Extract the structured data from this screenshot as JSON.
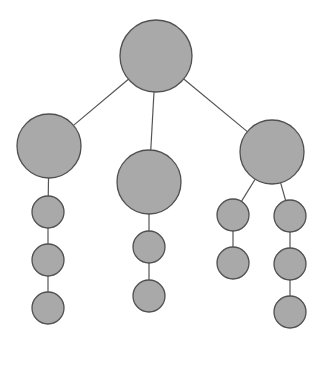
{
  "diagram": {
    "type": "tree",
    "canvas": {
      "width": 326,
      "height": 366,
      "background": "#ffffff"
    },
    "style": {
      "node_fill": "#a9a9a9",
      "node_stroke": "#505050",
      "edge_color": "#555555"
    },
    "nodes": [
      {
        "id": "root",
        "cx": 156,
        "cy": 56,
        "r": 36
      },
      {
        "id": "left",
        "cx": 49,
        "cy": 146,
        "r": 32
      },
      {
        "id": "middle",
        "cx": 149,
        "cy": 182,
        "r": 32
      },
      {
        "id": "right",
        "cx": 272,
        "cy": 152,
        "r": 32
      },
      {
        "id": "left-1",
        "cx": 48,
        "cy": 212,
        "r": 16
      },
      {
        "id": "left-2",
        "cx": 48,
        "cy": 260,
        "r": 16
      },
      {
        "id": "left-3",
        "cx": 48,
        "cy": 308,
        "r": 16
      },
      {
        "id": "middle-1",
        "cx": 149,
        "cy": 247,
        "r": 16
      },
      {
        "id": "middle-2",
        "cx": 149,
        "cy": 296,
        "r": 16
      },
      {
        "id": "right-a-1",
        "cx": 233,
        "cy": 215,
        "r": 16
      },
      {
        "id": "right-a-2",
        "cx": 233,
        "cy": 263,
        "r": 16
      },
      {
        "id": "right-b-1",
        "cx": 290,
        "cy": 216,
        "r": 16
      },
      {
        "id": "right-b-2",
        "cx": 290,
        "cy": 264,
        "r": 16
      },
      {
        "id": "right-b-3",
        "cx": 290,
        "cy": 312,
        "r": 16
      }
    ],
    "edges": [
      [
        "root",
        "left"
      ],
      [
        "root",
        "middle"
      ],
      [
        "root",
        "right"
      ],
      [
        "left",
        "left-1"
      ],
      [
        "left-1",
        "left-2"
      ],
      [
        "left-2",
        "left-3"
      ],
      [
        "middle",
        "middle-1"
      ],
      [
        "middle-1",
        "middle-2"
      ],
      [
        "right",
        "right-a-1"
      ],
      [
        "right-a-1",
        "right-a-2"
      ],
      [
        "right",
        "right-b-1"
      ],
      [
        "right-b-1",
        "right-b-2"
      ],
      [
        "right-b-2",
        "right-b-3"
      ]
    ]
  }
}
